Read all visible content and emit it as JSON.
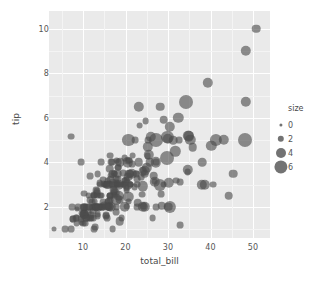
{
  "chart_data": {
    "type": "scatter",
    "title": "",
    "xlabel": "total_bill",
    "ylabel": "tip",
    "xlim": [
      2.0,
      54.0
    ],
    "ylim": [
      0.6,
      10.8
    ],
    "xticks": [
      10,
      20,
      30,
      40,
      50
    ],
    "yticks": [
      2,
      4,
      6,
      8,
      10
    ],
    "grid": true,
    "size_encoding": "size",
    "legend": {
      "title": "size",
      "position": "right",
      "entries": [
        {
          "label": "0",
          "value": 0,
          "radius_px": 1.6
        },
        {
          "label": "2",
          "value": 2,
          "radius_px": 3.2
        },
        {
          "label": "4",
          "value": 4,
          "radius_px": 5.0
        },
        {
          "label": "6",
          "value": 6,
          "radius_px": 6.6
        }
      ]
    },
    "marker_color": "#4c4c4c",
    "marker_opacity": 0.62,
    "panel_background": "#eaeaea",
    "gridline_color": "#ffffff",
    "points": [
      [
        16.99,
        1.01,
        2
      ],
      [
        10.34,
        1.66,
        3
      ],
      [
        21.01,
        3.5,
        3
      ],
      [
        23.68,
        3.31,
        2
      ],
      [
        24.59,
        3.61,
        4
      ],
      [
        25.29,
        4.71,
        4
      ],
      [
        8.77,
        2.0,
        2
      ],
      [
        26.88,
        3.12,
        4
      ],
      [
        15.04,
        1.96,
        2
      ],
      [
        14.78,
        3.23,
        2
      ],
      [
        10.27,
        1.71,
        2
      ],
      [
        35.26,
        5.0,
        4
      ],
      [
        15.42,
        1.57,
        2
      ],
      [
        18.43,
        3.0,
        4
      ],
      [
        14.83,
        3.02,
        2
      ],
      [
        21.58,
        3.92,
        2
      ],
      [
        10.33,
        1.67,
        3
      ],
      [
        16.29,
        3.71,
        3
      ],
      [
        16.97,
        3.5,
        3
      ],
      [
        20.65,
        3.35,
        3
      ],
      [
        17.92,
        4.08,
        2
      ],
      [
        20.29,
        2.75,
        2
      ],
      [
        15.77,
        2.23,
        2
      ],
      [
        39.42,
        7.58,
        4
      ],
      [
        19.82,
        3.18,
        2
      ],
      [
        17.81,
        2.34,
        4
      ],
      [
        13.37,
        2.0,
        2
      ],
      [
        12.69,
        2.0,
        2
      ],
      [
        21.7,
        4.3,
        2
      ],
      [
        19.65,
        3.0,
        2
      ],
      [
        9.55,
        1.45,
        2
      ],
      [
        18.35,
        2.5,
        4
      ],
      [
        15.06,
        3.0,
        2
      ],
      [
        20.69,
        2.45,
        4
      ],
      [
        17.78,
        3.27,
        2
      ],
      [
        24.06,
        3.6,
        3
      ],
      [
        16.31,
        2.0,
        3
      ],
      [
        16.93,
        3.07,
        3
      ],
      [
        18.69,
        2.31,
        3
      ],
      [
        31.27,
        5.0,
        3
      ],
      [
        16.04,
        2.24,
        3
      ],
      [
        17.46,
        2.54,
        2
      ],
      [
        13.94,
        3.06,
        2
      ],
      [
        9.68,
        1.32,
        2
      ],
      [
        30.4,
        5.6,
        4
      ],
      [
        18.29,
        3.0,
        2
      ],
      [
        22.23,
        5.0,
        2
      ],
      [
        32.4,
        6.0,
        4
      ],
      [
        28.55,
        2.05,
        3
      ],
      [
        18.04,
        3.0,
        2
      ],
      [
        12.54,
        2.5,
        2
      ],
      [
        10.29,
        2.6,
        2
      ],
      [
        34.81,
        5.2,
        4
      ],
      [
        9.94,
        1.56,
        2
      ],
      [
        25.56,
        4.34,
        4
      ],
      [
        19.49,
        3.51,
        2
      ],
      [
        38.01,
        3.0,
        4
      ],
      [
        26.41,
        1.5,
        2
      ],
      [
        11.24,
        1.76,
        2
      ],
      [
        48.27,
        6.73,
        4
      ],
      [
        20.29,
        3.21,
        2
      ],
      [
        13.81,
        2.0,
        2
      ],
      [
        11.02,
        1.98,
        2
      ],
      [
        18.29,
        3.76,
        2
      ],
      [
        17.59,
        2.64,
        3
      ],
      [
        20.08,
        3.15,
        3
      ],
      [
        16.45,
        2.47,
        2
      ],
      [
        3.07,
        1.0,
        1
      ],
      [
        20.23,
        2.01,
        2
      ],
      [
        15.01,
        2.09,
        2
      ],
      [
        12.02,
        1.97,
        2
      ],
      [
        17.07,
        3.0,
        3
      ],
      [
        26.86,
        3.14,
        2
      ],
      [
        25.28,
        5.0,
        2
      ],
      [
        14.73,
        2.2,
        2
      ],
      [
        10.51,
        1.25,
        2
      ],
      [
        17.92,
        3.08,
        2
      ],
      [
        27.2,
        4.0,
        4
      ],
      [
        22.76,
        3.0,
        2
      ],
      [
        17.29,
        2.71,
        2
      ],
      [
        19.44,
        3.0,
        2
      ],
      [
        16.66,
        3.4,
        2
      ],
      [
        10.07,
        1.83,
        1
      ],
      [
        32.68,
        5.0,
        2
      ],
      [
        15.98,
        2.03,
        2
      ],
      [
        34.83,
        5.17,
        4
      ],
      [
        13.03,
        2.0,
        2
      ],
      [
        18.28,
        4.0,
        2
      ],
      [
        24.71,
        5.85,
        2
      ],
      [
        21.16,
        3.0,
        2
      ],
      [
        28.97,
        3.0,
        2
      ],
      [
        22.49,
        3.5,
        2
      ],
      [
        5.75,
        1.0,
        2
      ],
      [
        16.32,
        4.3,
        2
      ],
      [
        22.75,
        3.25,
        2
      ],
      [
        40.17,
        4.73,
        4
      ],
      [
        27.28,
        4.0,
        2
      ],
      [
        12.03,
        1.5,
        2
      ],
      [
        21.01,
        3.0,
        2
      ],
      [
        12.46,
        1.5,
        2
      ],
      [
        11.35,
        2.5,
        2
      ],
      [
        15.38,
        3.0,
        2
      ],
      [
        44.3,
        2.5,
        3
      ],
      [
        22.42,
        3.48,
        2
      ],
      [
        20.92,
        4.08,
        2
      ],
      [
        15.36,
        1.64,
        2
      ],
      [
        20.49,
        4.06,
        2
      ],
      [
        25.21,
        4.29,
        2
      ],
      [
        18.24,
        3.76,
        2
      ],
      [
        14.31,
        4.0,
        2
      ],
      [
        14.0,
        3.0,
        2
      ],
      [
        7.25,
        1.0,
        2
      ],
      [
        38.07,
        4.0,
        3
      ],
      [
        23.95,
        2.55,
        2
      ],
      [
        25.71,
        4.0,
        3
      ],
      [
        17.31,
        3.5,
        2
      ],
      [
        29.93,
        5.07,
        4
      ],
      [
        10.65,
        1.5,
        2
      ],
      [
        12.43,
        1.8,
        2
      ],
      [
        24.08,
        2.92,
        4
      ],
      [
        11.69,
        2.31,
        2
      ],
      [
        13.42,
        1.68,
        2
      ],
      [
        14.26,
        2.5,
        2
      ],
      [
        15.95,
        2.0,
        2
      ],
      [
        12.48,
        2.52,
        2
      ],
      [
        29.8,
        4.2,
        6
      ],
      [
        8.52,
        1.48,
        2
      ],
      [
        14.52,
        2.0,
        2
      ],
      [
        11.38,
        2.0,
        2
      ],
      [
        22.82,
        2.18,
        3
      ],
      [
        19.08,
        1.5,
        2
      ],
      [
        20.27,
        2.83,
        2
      ],
      [
        11.17,
        1.5,
        2
      ],
      [
        12.26,
        2.0,
        2
      ],
      [
        18.26,
        3.25,
        2
      ],
      [
        8.51,
        1.25,
        2
      ],
      [
        10.33,
        2.0,
        2
      ],
      [
        14.15,
        2.0,
        2
      ],
      [
        16.0,
        2.0,
        2
      ],
      [
        13.16,
        2.75,
        2
      ],
      [
        17.47,
        3.5,
        2
      ],
      [
        34.3,
        6.7,
        6
      ],
      [
        41.19,
        5.0,
        5
      ],
      [
        27.05,
        5.0,
        6
      ],
      [
        16.43,
        2.3,
        2
      ],
      [
        8.35,
        1.5,
        2
      ],
      [
        18.64,
        1.36,
        3
      ],
      [
        11.87,
        1.63,
        2
      ],
      [
        9.78,
        1.73,
        2
      ],
      [
        7.51,
        2.0,
        2
      ],
      [
        14.07,
        2.5,
        2
      ],
      [
        13.13,
        2.0,
        2
      ],
      [
        17.26,
        2.74,
        3
      ],
      [
        24.55,
        2.0,
        4
      ],
      [
        19.77,
        2.0,
        4
      ],
      [
        29.85,
        5.14,
        5
      ],
      [
        48.17,
        5.0,
        6
      ],
      [
        25.0,
        3.75,
        4
      ],
      [
        13.39,
        2.61,
        2
      ],
      [
        16.49,
        2.0,
        4
      ],
      [
        21.5,
        3.5,
        4
      ],
      [
        12.66,
        2.5,
        2
      ],
      [
        16.21,
        2.0,
        3
      ],
      [
        13.81,
        2.0,
        2
      ],
      [
        17.51,
        3.0,
        2
      ],
      [
        24.52,
        3.48,
        3
      ],
      [
        20.76,
        2.24,
        2
      ],
      [
        31.71,
        4.5,
        4
      ],
      [
        10.59,
        1.61,
        2
      ],
      [
        10.63,
        2.0,
        2
      ],
      [
        50.81,
        10.0,
        3
      ],
      [
        15.81,
        3.16,
        2
      ],
      [
        7.25,
        5.15,
        2
      ],
      [
        31.85,
        3.18,
        2
      ],
      [
        16.82,
        4.0,
        2
      ],
      [
        32.9,
        3.11,
        2
      ],
      [
        17.89,
        2.0,
        2
      ],
      [
        14.48,
        2.0,
        2
      ],
      [
        9.6,
        4.0,
        2
      ],
      [
        34.63,
        3.55,
        2
      ],
      [
        34.65,
        3.68,
        4
      ],
      [
        23.33,
        5.65,
        2
      ],
      [
        45.35,
        3.5,
        3
      ],
      [
        23.17,
        6.5,
        4
      ],
      [
        40.55,
        3.0,
        2
      ],
      [
        20.69,
        5.0,
        5
      ],
      [
        20.9,
        3.5,
        3
      ],
      [
        30.46,
        2.0,
        5
      ],
      [
        18.15,
        3.5,
        3
      ],
      [
        23.1,
        4.0,
        3
      ],
      [
        15.69,
        1.5,
        2
      ],
      [
        19.81,
        4.19,
        2
      ],
      [
        28.44,
        2.56,
        2
      ],
      [
        15.48,
        2.02,
        2
      ],
      [
        16.58,
        4.0,
        2
      ],
      [
        7.56,
        1.44,
        2
      ],
      [
        10.34,
        2.0,
        2
      ],
      [
        43.11,
        5.0,
        4
      ],
      [
        13.0,
        2.0,
        2
      ],
      [
        13.51,
        2.0,
        2
      ],
      [
        18.71,
        4.0,
        3
      ],
      [
        12.74,
        2.01,
        2
      ],
      [
        13.0,
        2.0,
        2
      ],
      [
        16.4,
        2.5,
        2
      ],
      [
        20.53,
        4.0,
        4
      ],
      [
        16.47,
        3.23,
        3
      ],
      [
        26.59,
        3.41,
        3
      ],
      [
        38.73,
        3.0,
        4
      ],
      [
        24.27,
        2.03,
        2
      ],
      [
        12.76,
        2.23,
        2
      ],
      [
        30.06,
        2.0,
        3
      ],
      [
        25.89,
        5.16,
        4
      ],
      [
        48.33,
        9.0,
        4
      ],
      [
        13.27,
        2.5,
        2
      ],
      [
        28.17,
        6.5,
        3
      ],
      [
        12.9,
        1.1,
        2
      ],
      [
        28.15,
        3.0,
        5
      ],
      [
        11.59,
        1.5,
        2
      ],
      [
        7.74,
        1.44,
        2
      ],
      [
        30.14,
        3.09,
        4
      ],
      [
        12.16,
        2.2,
        2
      ],
      [
        13.42,
        3.48,
        2
      ],
      [
        8.58,
        1.92,
        1
      ],
      [
        15.98,
        3.0,
        3
      ],
      [
        13.42,
        1.58,
        2
      ],
      [
        16.27,
        2.5,
        2
      ],
      [
        10.09,
        2.0,
        2
      ],
      [
        20.45,
        3.0,
        4
      ],
      [
        13.28,
        2.72,
        2
      ],
      [
        22.12,
        2.88,
        2
      ],
      [
        24.01,
        2.0,
        4
      ],
      [
        15.69,
        3.0,
        3
      ],
      [
        11.61,
        3.39,
        2
      ],
      [
        10.77,
        1.47,
        2
      ],
      [
        15.53,
        3.0,
        2
      ],
      [
        10.07,
        1.25,
        2
      ],
      [
        12.6,
        1.0,
        2
      ],
      [
        32.83,
        1.17,
        2
      ],
      [
        35.83,
        4.67,
        3
      ],
      [
        29.03,
        5.92,
        3
      ],
      [
        27.18,
        2.0,
        2
      ],
      [
        22.67,
        2.0,
        2
      ],
      [
        17.82,
        1.75,
        2
      ],
      [
        18.78,
        3.0,
        2
      ]
    ]
  }
}
